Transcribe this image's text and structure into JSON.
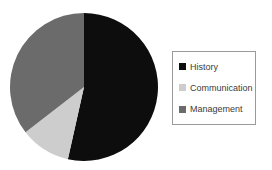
{
  "chart_data": {
    "type": "pie",
    "title": "",
    "xlabel": "",
    "ylabel": "",
    "categories": [
      "History",
      "Communication",
      "Management"
    ],
    "values": [
      53.5,
      11.0,
      35.5
    ],
    "units": "percent",
    "colors": [
      "#0d0d0d",
      "#cdcdcd",
      "#6b6b6b"
    ],
    "start_angle_deg": 0,
    "direction": "clockwise",
    "legend_position": "right",
    "grid": false,
    "slices": [
      {
        "label": "History",
        "value": 53.5,
        "color": "#0d0d0d",
        "start_deg": 0,
        "end_deg": 192.6
      },
      {
        "label": "Communication",
        "value": 11.0,
        "color": "#cdcdcd",
        "start_deg": 192.6,
        "end_deg": 232.2
      },
      {
        "label": "Management",
        "value": 35.5,
        "color": "#6b6b6b",
        "start_deg": 232.2,
        "end_deg": 360
      }
    ]
  },
  "legend": {
    "items": [
      {
        "label": "History",
        "color": "#0d0d0d"
      },
      {
        "label": "Communication",
        "color": "#cdcdcd"
      },
      {
        "label": "Management",
        "color": "#6b6b6b"
      }
    ],
    "border_color": "#9a9a9a"
  },
  "geometry": {
    "center_x": 84,
    "center_y": 87,
    "radius": 74
  },
  "canvas": {
    "background": "#ffffff",
    "width": 272,
    "height": 170
  }
}
